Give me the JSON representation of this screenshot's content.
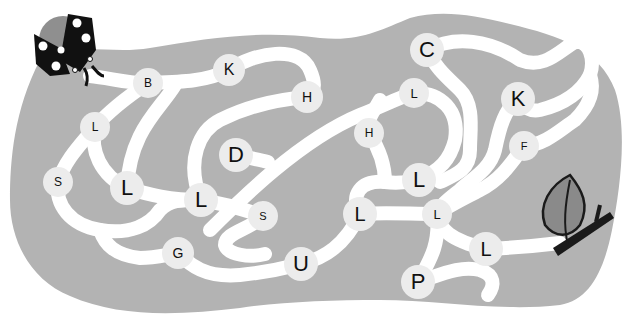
{
  "puzzle": {
    "type": "letter-maze",
    "start": {
      "label": "ladybug",
      "x": 68,
      "y": 44
    },
    "finish": {
      "label": "leaf-on-twig",
      "x": 578,
      "y": 228
    },
    "colors": {
      "background": "#ffffff",
      "blob": "#b3b3b3",
      "path": "#ffffff",
      "node": "#ececec",
      "text": "#111111"
    }
  },
  "nodes": [
    {
      "id": "n1",
      "letter": "B",
      "x": 148,
      "y": 83,
      "size": "sm"
    },
    {
      "id": "n2",
      "letter": "K",
      "x": 229,
      "y": 70,
      "size": "md"
    },
    {
      "id": "n3",
      "letter": "H",
      "x": 307,
      "y": 97,
      "size": "md"
    },
    {
      "id": "n4",
      "letter": "L",
      "x": 95,
      "y": 127,
      "size": "sm"
    },
    {
      "id": "n5",
      "letter": "C",
      "x": 427,
      "y": 50,
      "size": "lg"
    },
    {
      "id": "n6",
      "letter": "L",
      "x": 414,
      "y": 93,
      "size": "sm"
    },
    {
      "id": "n7",
      "letter": "K",
      "x": 518,
      "y": 99,
      "size": "lg"
    },
    {
      "id": "n8",
      "letter": "H",
      "x": 369,
      "y": 133,
      "size": "sm"
    },
    {
      "id": "n9",
      "letter": "D",
      "x": 236,
      "y": 155,
      "size": "lg"
    },
    {
      "id": "n10",
      "letter": "F",
      "x": 524,
      "y": 146,
      "size": "sm"
    },
    {
      "id": "n11",
      "letter": "S",
      "x": 58,
      "y": 182,
      "size": "sm"
    },
    {
      "id": "n12",
      "letter": "L",
      "x": 127,
      "y": 188,
      "size": "lg"
    },
    {
      "id": "n13",
      "letter": "L",
      "x": 419,
      "y": 180,
      "size": "lg"
    },
    {
      "id": "n14",
      "letter": "L",
      "x": 201,
      "y": 200,
      "size": "lg"
    },
    {
      "id": "n15",
      "letter": "S",
      "x": 263,
      "y": 216,
      "size": "sm"
    },
    {
      "id": "n16",
      "letter": "L",
      "x": 360,
      "y": 214,
      "size": "lg"
    },
    {
      "id": "n17",
      "letter": "L",
      "x": 437,
      "y": 214,
      "size": "sm"
    },
    {
      "id": "n18",
      "letter": "G",
      "x": 178,
      "y": 253,
      "size": "md"
    },
    {
      "id": "n19",
      "letter": "L",
      "x": 486,
      "y": 249,
      "size": "lg"
    },
    {
      "id": "n20",
      "letter": "U",
      "x": 301,
      "y": 264,
      "size": "lg"
    },
    {
      "id": "n21",
      "letter": "P",
      "x": 418,
      "y": 282,
      "size": "lg"
    }
  ]
}
